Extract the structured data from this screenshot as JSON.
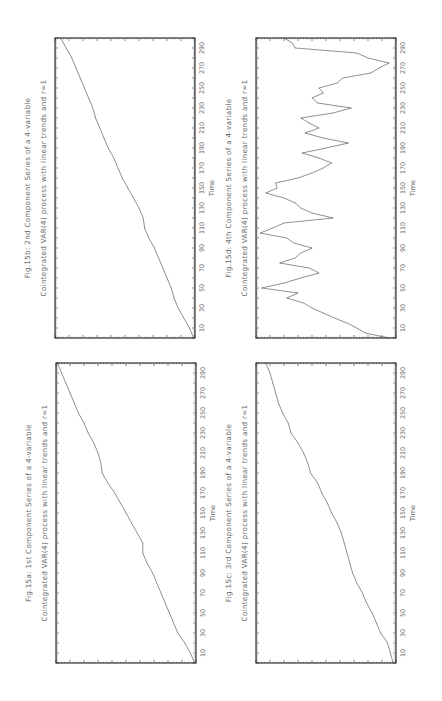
{
  "chart_data": [
    {
      "id": "fig15b",
      "type": "line",
      "title": "Fig.15b: 2nd Component Series of a 4-variable",
      "subtitle": "Cointegrated VAR(4) process with  linear trends and r=1",
      "xlabel": "Time",
      "ylabel": "",
      "xlim": [
        0,
        300
      ],
      "ylim": [
        0,
        100
      ],
      "xticks": [
        "10",
        "30",
        "50",
        "70",
        "90",
        "110",
        "130",
        "150",
        "170",
        "190",
        "210",
        "230",
        "250",
        "270",
        "290"
      ],
      "x": [
        0,
        10,
        20,
        30,
        40,
        50,
        60,
        70,
        80,
        90,
        100,
        110,
        120,
        130,
        140,
        150,
        160,
        170,
        180,
        190,
        200,
        210,
        220,
        230,
        240,
        250,
        260,
        270,
        280,
        290,
        300
      ],
      "values": [
        1,
        4,
        8,
        12,
        15,
        17,
        20,
        23,
        26,
        29,
        33,
        36,
        37,
        40,
        44,
        48,
        52,
        55,
        58,
        62,
        65,
        68,
        71,
        73,
        76,
        79,
        82,
        85,
        88,
        92,
        96
      ]
    },
    {
      "id": "fig15d",
      "type": "line",
      "title": "Fig.15d: 4th Component Series of a 4-variable",
      "subtitle": "Cointegrated VAR(4) process with  linear trends and r=1",
      "xlabel": "Time",
      "ylabel": "",
      "xlim": [
        0,
        300
      ],
      "ylim": [
        0,
        100
      ],
      "xticks": [
        "10",
        "30",
        "50",
        "70",
        "90",
        "110",
        "130",
        "150",
        "170",
        "190",
        "210",
        "230",
        "250",
        "270",
        "290"
      ],
      "x": [
        0,
        5,
        10,
        15,
        20,
        25,
        30,
        35,
        40,
        45,
        50,
        55,
        60,
        65,
        70,
        75,
        80,
        85,
        90,
        95,
        100,
        105,
        110,
        115,
        120,
        125,
        130,
        135,
        140,
        145,
        150,
        155,
        160,
        165,
        170,
        175,
        180,
        185,
        190,
        195,
        200,
        205,
        210,
        215,
        220,
        225,
        230,
        235,
        240,
        245,
        250,
        255,
        260,
        265,
        270,
        275,
        280,
        285,
        290,
        295,
        300
      ],
      "values": [
        5,
        22,
        28,
        35,
        44,
        52,
        60,
        66,
        78,
        70,
        96,
        80,
        68,
        55,
        62,
        83,
        72,
        68,
        60,
        73,
        78,
        97,
        88,
        80,
        45,
        60,
        68,
        72,
        80,
        93,
        85,
        86,
        70,
        60,
        52,
        46,
        55,
        67,
        50,
        34,
        52,
        65,
        55,
        62,
        68,
        45,
        32,
        56,
        60,
        52,
        55,
        42,
        38,
        18,
        12,
        5,
        20,
        28,
        72,
        74,
        80
      ]
    },
    {
      "id": "fig15a",
      "type": "line",
      "title": "Fig.15a: 1st Component Series of a 4-variable",
      "subtitle": "Cointegrated VAR(4) process with  linear trends and r=1",
      "xlabel": "Time",
      "ylabel": "",
      "xlim": [
        0,
        300
      ],
      "ylim": [
        0,
        100
      ],
      "xticks": [
        "10",
        "30",
        "50",
        "70",
        "90",
        "110",
        "130",
        "150",
        "170",
        "190",
        "210",
        "230",
        "250",
        "270",
        "290"
      ],
      "x": [
        0,
        10,
        20,
        30,
        40,
        50,
        60,
        70,
        80,
        90,
        100,
        110,
        120,
        130,
        140,
        150,
        160,
        170,
        180,
        190,
        200,
        210,
        220,
        230,
        240,
        250,
        260,
        270,
        280,
        290,
        300
      ],
      "values": [
        1,
        4,
        8,
        13,
        16,
        19,
        22,
        25,
        28,
        31,
        35,
        38,
        38,
        42,
        46,
        50,
        54,
        58,
        63,
        67,
        68,
        70,
        73,
        77,
        80,
        84,
        87,
        90,
        93,
        96,
        99
      ]
    },
    {
      "id": "fig15c",
      "type": "line",
      "title": "Fig.15c: 3rd Component Series of a 4-variable",
      "subtitle": "Cointegrated VAR(4) process with  linear trends and r=1",
      "xlabel": "Time",
      "ylabel": "",
      "xlim": [
        0,
        300
      ],
      "ylim": [
        0,
        100
      ],
      "xticks": [
        "10",
        "30",
        "50",
        "70",
        "90",
        "110",
        "130",
        "150",
        "170",
        "190",
        "210",
        "230",
        "250",
        "270",
        "290"
      ],
      "x": [
        0,
        10,
        20,
        30,
        40,
        50,
        60,
        70,
        80,
        90,
        100,
        110,
        120,
        130,
        140,
        150,
        160,
        170,
        180,
        190,
        200,
        210,
        220,
        230,
        240,
        250,
        260,
        270,
        280,
        290,
        300
      ],
      "values": [
        2,
        4,
        6,
        11,
        14,
        17,
        21,
        24,
        28,
        31,
        33,
        35,
        37,
        39,
        42,
        46,
        49,
        53,
        56,
        61,
        63,
        66,
        70,
        75,
        77,
        81,
        84,
        86,
        88,
        90,
        93
      ]
    }
  ]
}
